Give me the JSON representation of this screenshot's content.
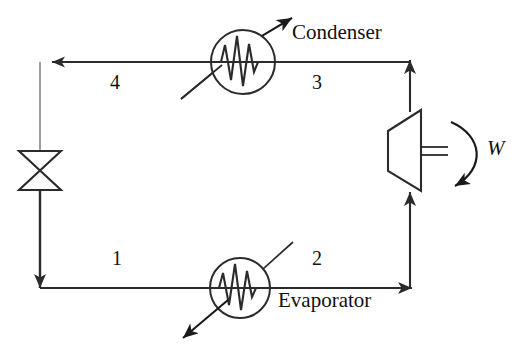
{
  "diagram": {
    "type": "process-flow-diagram",
    "background_color": "#ffffff",
    "line_color": "#2b2b2b",
    "text_color": "#111111",
    "components": {
      "condenser": {
        "label": "Condenser",
        "symbol": "circle-with-zigzag",
        "heat_arrow": "out-up-right"
      },
      "evaporator": {
        "label": "Evaporator",
        "symbol": "circle-with-zigzag",
        "heat_arrow": "out-down-left"
      },
      "compressor": {
        "label": "",
        "symbol": "trapezoid",
        "shaft_symbol": "double-line"
      },
      "expansion_valve": {
        "label": "",
        "symbol": "bowtie-valve"
      }
    },
    "state_points": [
      {
        "id": "1",
        "label": "1",
        "position": "bottom-left-line"
      },
      {
        "id": "2",
        "label": "2",
        "position": "bottom-right-line"
      },
      {
        "id": "3",
        "label": "3",
        "position": "top-right-line"
      },
      {
        "id": "4",
        "label": "4",
        "position": "top-left-line"
      }
    ],
    "work": {
      "label": "W",
      "arrow": "curved-into-compressor",
      "direction": "in"
    },
    "flow_arrows": [
      {
        "name": "top-line-leftward",
        "direction": "left"
      },
      {
        "name": "valve-outlet-downward",
        "direction": "down"
      },
      {
        "name": "bottom-line-rightward",
        "direction": "right"
      },
      {
        "name": "compressor-inlet-upward",
        "direction": "up"
      },
      {
        "name": "compressor-outlet-upward",
        "direction": "up"
      }
    ]
  }
}
